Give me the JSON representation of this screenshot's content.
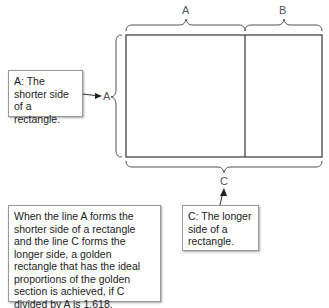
{
  "labels": {
    "a_top": "A",
    "b_top": "B",
    "a_left": "A",
    "c_bottom": "C"
  },
  "boxes": {
    "a_note": "A: The shorter side of a rectangle.",
    "c_note": "C: The longer side of a rectangle.",
    "explanation": "When the line A forms the shorter side of a rectangle and the line C forms the longer side, a golden rectangle that has the ideal proportions of the golden section is achieved, if C divided by A is 1.618."
  }
}
